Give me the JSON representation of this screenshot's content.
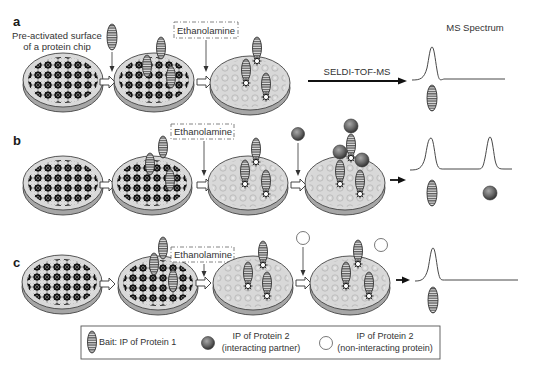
{
  "figure": {
    "panels": [
      {
        "id": "a",
        "label": "a",
        "chip_label_line1": "Pre-activated surface",
        "chip_label_line2": "of a protein chip",
        "blocker": "Ethanolamine",
        "method_label": "SELDI-TOF-MS",
        "spectrum_title": "MS Spectrum",
        "peaks": [
          "bait"
        ]
      },
      {
        "id": "b",
        "label": "b",
        "blocker": "Ethanolamine",
        "added_protein": "interacting partner",
        "peaks": [
          "bait",
          "interacting partner"
        ]
      },
      {
        "id": "c",
        "label": "c",
        "blocker": "Ethanolamine",
        "added_protein": "non-interacting protein",
        "peaks": [
          "bait"
        ]
      }
    ],
    "legend": {
      "items": [
        {
          "icon": "striped-oval-icon",
          "line1": "Bait: IP of Protein 1",
          "line2": ""
        },
        {
          "icon": "dark-sphere-icon",
          "line1": "IP of Protein 2",
          "line2": "(interacting partner)"
        },
        {
          "icon": "white-circle-icon",
          "line1": "IP of Protein 2",
          "line2": "(non-interacting protein)"
        }
      ]
    },
    "colors": {
      "chip_fill": "#d9d9d9",
      "chip_edge": "#8c8c8c",
      "bait_fill": "#8f8f8f",
      "sphere_fill": "#6e6e6e",
      "text": "#333333"
    }
  }
}
